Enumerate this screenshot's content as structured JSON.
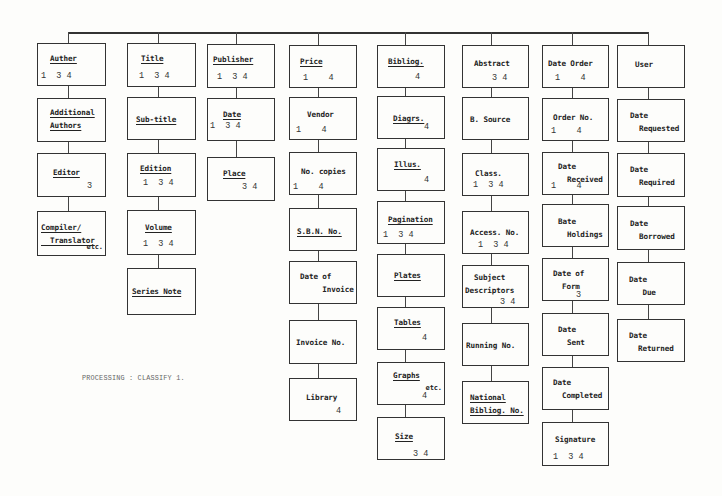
{
  "diagram": {
    "type": "data-element hierarchy (library processing)",
    "note": "PROCESSING : CLASSIFY 1.",
    "columns": [
      {
        "name": "Auther",
        "x": 37,
        "w": 69,
        "stem": 68,
        "boxes": [
          {
            "lines": [
              "Auther"
            ],
            "underline": true,
            "codes": "1  3 4",
            "y": 43,
            "h": 43,
            "lx": 12,
            "ly": 10,
            "cx": 3,
            "cy": 27
          },
          {
            "lines": [
              "Additional",
              "Authors"
            ],
            "underline": true,
            "codes": "",
            "y": 98,
            "h": 44,
            "lx": 12,
            "ly": 9,
            "cx": 0,
            "cy": 0
          },
          {
            "lines": [
              "Editor"
            ],
            "underline": true,
            "codes": "3",
            "y": 153,
            "h": 44,
            "lx": 15,
            "ly": 14,
            "cx": 49,
            "cy": 27
          },
          {
            "lines": [
              "Compiler/",
              "  Translator"
            ],
            "underline": true,
            "codes": "",
            "extra": "etc.",
            "y": 211,
            "h": 45,
            "lx": 3,
            "ly": 11,
            "cx": 0,
            "cy": 0
          }
        ]
      },
      {
        "name": "Title",
        "x": 127,
        "w": 69,
        "stem": 158,
        "boxes": [
          {
            "lines": [
              "Title"
            ],
            "underline": true,
            "codes": "1  3 4",
            "y": 43,
            "h": 44,
            "lx": 13,
            "ly": 10,
            "cx": 11,
            "cy": 27
          },
          {
            "lines": [
              "Sub-title"
            ],
            "underline": true,
            "codes": "",
            "y": 97,
            "h": 43,
            "lx": 8,
            "ly": 17,
            "cx": 0,
            "cy": 0
          },
          {
            "lines": [
              "Edition"
            ],
            "underline": true,
            "codes": "1  3 4",
            "y": 153,
            "h": 44,
            "lx": 12,
            "ly": 10,
            "cx": 15,
            "cy": 24
          },
          {
            "lines": [
              "Volume"
            ],
            "underline": true,
            "codes": "1  3 4",
            "y": 210,
            "h": 45,
            "lx": 17,
            "ly": 12,
            "cx": 15,
            "cy": 28
          },
          {
            "lines": [
              "Series Note"
            ],
            "underline": true,
            "codes": "",
            "y": 268,
            "h": 47,
            "lx": 4,
            "ly": 18,
            "cx": 0,
            "cy": 0
          }
        ]
      },
      {
        "name": "Publisher",
        "x": 207,
        "w": 68,
        "stem": 236,
        "boxes": [
          {
            "lines": [
              "Publisher"
            ],
            "underline": true,
            "codes": "1  3 4",
            "y": 44,
            "h": 44,
            "lx": 5,
            "ly": 10,
            "cx": 9,
            "cy": 27
          },
          {
            "lines": [
              "Date"
            ],
            "underline": true,
            "codes": "1  3 4",
            "y": 98,
            "h": 43,
            "lx": 15,
            "ly": 11,
            "cx": 2,
            "cy": 22
          },
          {
            "lines": [
              "Place"
            ],
            "underline": true,
            "codes": "3 4",
            "y": 157,
            "h": 44,
            "lx": 15,
            "ly": 11,
            "cx": 34,
            "cy": 24
          }
        ]
      },
      {
        "name": "Price",
        "x": 289,
        "w": 68,
        "stem": 318,
        "boxes": [
          {
            "lines": [
              "Price"
            ],
            "underline": true,
            "codes": "1    4",
            "y": 45,
            "h": 43,
            "lx": 10,
            "ly": 11,
            "cx": 13,
            "cy": 27
          },
          {
            "lines": [
              "Vendor"
            ],
            "underline": true,
            "plain": true,
            "codes": "1    4",
            "y": 97,
            "h": 43,
            "lx": 17,
            "ly": 12,
            "cx": 6,
            "cy": 27
          },
          {
            "lines": [
              "No. copies"
            ],
            "plain": true,
            "codes": "1    4",
            "y": 152,
            "h": 43,
            "lx": 11,
            "ly": 14,
            "cx": 3,
            "cy": 29
          },
          {
            "lines": [
              "S.B.N. No."
            ],
            "underline": true,
            "codes": "",
            "y": 208,
            "h": 43,
            "lx": 7,
            "ly": 18,
            "cx": 0,
            "cy": 0
          },
          {
            "lines": [
              "Date of",
              "     Invoice"
            ],
            "plain": true,
            "codes": "",
            "y": 261,
            "h": 43,
            "lx": 10,
            "ly": 10,
            "cx": 0,
            "cy": 0
          },
          {
            "lines": [
              "Invoice No."
            ],
            "plain": true,
            "codes": "",
            "y": 320,
            "h": 44,
            "lx": 6,
            "ly": 17,
            "cx": 0,
            "cy": 0
          },
          {
            "lines": [
              "Library"
            ],
            "plain": true,
            "codes": "4",
            "y": 378,
            "h": 43,
            "lx": 16,
            "ly": 14,
            "cx": 46,
            "cy": 27
          }
        ]
      },
      {
        "name": "Bibliog.",
        "x": 377,
        "w": 68,
        "stem": 405,
        "boxes": [
          {
            "lines": [
              "Bibliog."
            ],
            "underline": true,
            "codes": "4",
            "y": 45,
            "h": 43,
            "lx": 10,
            "ly": 11,
            "cx": 37,
            "cy": 26
          },
          {
            "lines": [
              "Diagrs."
            ],
            "underline": true,
            "codes": "4",
            "y": 96,
            "h": 43,
            "lx": 15,
            "ly": 17,
            "cx": 46,
            "cy": 25
          },
          {
            "lines": [
              "Illus."
            ],
            "underline": true,
            "codes": "4",
            "y": 148,
            "h": 43,
            "lx": 16,
            "ly": 11,
            "cx": 46,
            "cy": 26
          },
          {
            "lines": [
              "Pagination"
            ],
            "underline": true,
            "codes": "1  3 4",
            "y": 201,
            "h": 43,
            "lx": 10,
            "ly": 13,
            "cx": 5,
            "cy": 28
          },
          {
            "lines": [
              "Plates"
            ],
            "underline": true,
            "codes": "",
            "y": 254,
            "h": 43,
            "lx": 16,
            "ly": 16,
            "cx": 0,
            "cy": 0
          },
          {
            "lines": [
              "Tables"
            ],
            "underline": true,
            "codes": "4",
            "y": 307,
            "h": 43,
            "lx": 16,
            "ly": 10,
            "cx": 44,
            "cy": 25
          },
          {
            "lines": [
              "Graphs"
            ],
            "underline": true,
            "codes": "4",
            "extra": "etc.",
            "y": 362,
            "h": 43,
            "lx": 15,
            "ly": 8,
            "cx": 44,
            "cy": 28
          },
          {
            "lines": [
              "Size"
            ],
            "underline": true,
            "codes": "3 4",
            "y": 417,
            "h": 43,
            "lx": 17,
            "ly": 14,
            "cx": 35,
            "cy": 31
          }
        ]
      },
      {
        "name": "Abstract",
        "x": 462,
        "w": 67,
        "stem": 491,
        "boxes": [
          {
            "lines": [
              "Abstract"
            ],
            "plain": true,
            "codes": "3 4",
            "y": 45,
            "h": 43,
            "lx": 11,
            "ly": 13,
            "cx": 29,
            "cy": 27
          },
          {
            "lines": [
              "B. Source"
            ],
            "plain": true,
            "codes": "",
            "y": 97,
            "h": 43,
            "lx": 7,
            "ly": 17,
            "cx": 0,
            "cy": 0
          },
          {
            "lines": [
              "Class."
            ],
            "plain": true,
            "codes": "1  3 4",
            "y": 153,
            "h": 43,
            "lx": 12,
            "ly": 15,
            "cx": 10,
            "cy": 26
          },
          {
            "lines": [
              "Access. No."
            ],
            "plain": true,
            "codes": "1  3 4",
            "y": 211,
            "h": 43,
            "lx": 7,
            "ly": 16,
            "cx": 15,
            "cy": 28
          },
          {
            "lines": [
              "  Subject",
              "Descriptors"
            ],
            "plain": true,
            "codes": "3 4",
            "y": 265,
            "h": 43,
            "lx": 2,
            "ly": 7,
            "cx": 37,
            "cy": 31
          },
          {
            "lines": [
              "Running No."
            ],
            "plain": true,
            "codes": "",
            "y": 323,
            "h": 43,
            "lx": 3,
            "ly": 17,
            "cx": 0,
            "cy": 0
          },
          {
            "lines": [
              "National",
              "Bibliog. No."
            ],
            "underline": true,
            "codes": "",
            "y": 381,
            "h": 43,
            "lx": 7,
            "ly": 11,
            "cx": 0,
            "cy": 0
          }
        ]
      },
      {
        "name": "Date Order",
        "x": 542,
        "w": 67,
        "stem": 572,
        "boxes": [
          {
            "lines": [
              "Date Order"
            ],
            "plain": true,
            "codes": "1    4",
            "y": 45,
            "h": 43,
            "lx": 5,
            "ly": 13,
            "cx": 12,
            "cy": 27
          },
          {
            "lines": [
              "Order No."
            ],
            "plain": true,
            "codes": "1    4",
            "y": 98,
            "h": 43,
            "lx": 10,
            "ly": 14,
            "cx": 8,
            "cy": 27
          },
          {
            "lines": [
              "Date",
              "  Received"
            ],
            "plain": true,
            "codes": "1    4",
            "y": 152,
            "h": 43,
            "lx": 15,
            "ly": 9,
            "cx": 8,
            "cy": 28
          },
          {
            "lines": [
              "Bate",
              "  Holdings"
            ],
            "plain": true,
            "codes": "",
            "y": 204,
            "h": 43,
            "lx": 15,
            "ly": 12,
            "cx": 0,
            "cy": 0
          },
          {
            "lines": [
              "Date of",
              "  Form"
            ],
            "plain": true,
            "codes": "3",
            "y": 258,
            "h": 43,
            "lx": 10,
            "ly": 10,
            "cx": 33,
            "cy": 31
          },
          {
            "lines": [
              "Date",
              "  Sent"
            ],
            "plain": true,
            "codes": "",
            "y": 313,
            "h": 43,
            "lx": 15,
            "ly": 11,
            "cx": 0,
            "cy": 0
          },
          {
            "lines": [
              "Date",
              "  Completed"
            ],
            "plain": true,
            "codes": "",
            "y": 367,
            "h": 43,
            "lx": 10,
            "ly": 10,
            "cx": 0,
            "cy": 0
          },
          {
            "lines": [
              "Signature"
            ],
            "plain": true,
            "codes": "1  3 4",
            "y": 422,
            "h": 44,
            "lx": 12,
            "ly": 12,
            "cx": 10,
            "cy": 29
          }
        ]
      },
      {
        "name": "User",
        "x": 617,
        "w": 68,
        "stem": 648,
        "boxes": [
          {
            "lines": [
              "User"
            ],
            "plain": true,
            "codes": "",
            "y": 45,
            "h": 43,
            "lx": 17,
            "ly": 14,
            "cx": 0,
            "cy": 0
          },
          {
            "lines": [
              "Date",
              "  Requested"
            ],
            "plain": true,
            "codes": "",
            "y": 99,
            "h": 43,
            "lx": 12,
            "ly": 11,
            "cx": 0,
            "cy": 0
          },
          {
            "lines": [
              "Date",
              "  Required"
            ],
            "plain": true,
            "codes": "",
            "y": 153,
            "h": 44,
            "lx": 12,
            "ly": 11,
            "cx": 0,
            "cy": 0
          },
          {
            "lines": [
              "Date",
              "  Borrowed"
            ],
            "plain": true,
            "codes": "",
            "y": 206,
            "h": 44,
            "lx": 12,
            "ly": 12,
            "cx": 0,
            "cy": 0
          },
          {
            "lines": [
              "Date",
              "   Due"
            ],
            "plain": true,
            "codes": "",
            "y": 262,
            "h": 43,
            "lx": 11,
            "ly": 12,
            "cx": 0,
            "cy": 0
          },
          {
            "lines": [
              "Date",
              "  Returned"
            ],
            "plain": true,
            "codes": "",
            "y": 319,
            "h": 43,
            "lx": 11,
            "ly": 11,
            "cx": 0,
            "cy": 0
          }
        ]
      }
    ],
    "top_line": {
      "y": 32,
      "x1": 68,
      "x2": 649
    }
  }
}
